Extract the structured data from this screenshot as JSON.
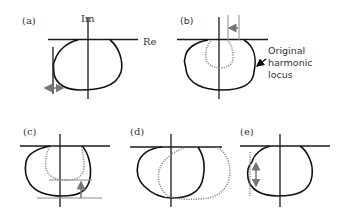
{
  "figure": {
    "panels": [
      {
        "id": "a",
        "label": "(a)",
        "axis_labels": {
          "imaginary": "Im",
          "real": "Re"
        },
        "annotation": "horizontal double-headed arrow at left boundary of locus"
      },
      {
        "id": "b",
        "label": "(b)",
        "callout": {
          "line1": "Original",
          "line2": "harmonic",
          "line3": "locus"
        },
        "annotation": "leftward arrow indicating shrink of locus width; dotted shrunken locus inside original"
      },
      {
        "id": "c",
        "label": "(c)",
        "annotation": "upward arrow indicating reduced locus depth; dotted locus shallower"
      },
      {
        "id": "d",
        "label": "(d)",
        "annotation": "dotted locus shifted to the right"
      },
      {
        "id": "e",
        "label": "(e)",
        "annotation": "vertical double-headed arrow with dotted vertical line at left edge of locus"
      }
    ]
  },
  "colors": {
    "line": "#111111",
    "dotted": "#8a8a8a",
    "arrow": "#777777",
    "background": "#ffffff"
  }
}
